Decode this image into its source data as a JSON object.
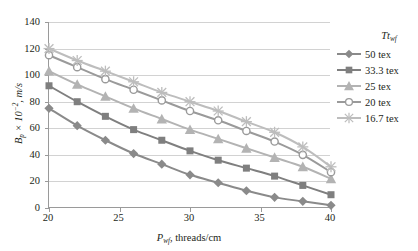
{
  "chart_data": {
    "type": "line",
    "title": "",
    "xlabel": "P_wf, threads/cm",
    "ylabel": "B_p x 10^-2, m/s",
    "xlim": [
      20,
      40
    ],
    "ylim": [
      0,
      140
    ],
    "xticks": [
      20,
      25,
      30,
      35,
      40
    ],
    "yticks": [
      0,
      20,
      40,
      60,
      80,
      100,
      120,
      140
    ],
    "grid": true,
    "legend_position": "right",
    "legend_title": "Tt_wf",
    "x": [
      20,
      22,
      24,
      26,
      28,
      30,
      32,
      34,
      36,
      38,
      40
    ],
    "series": [
      {
        "name": "50 tex",
        "marker": "diamond",
        "color": "#8a8a8a",
        "values": [
          75,
          62,
          51,
          41,
          33,
          25,
          19,
          13,
          8,
          5,
          2
        ]
      },
      {
        "name": "33.3 tex",
        "marker": "square",
        "color": "#7f7f7f",
        "values": [
          92,
          80,
          69,
          59,
          51,
          43,
          36,
          30,
          24,
          17,
          10
        ]
      },
      {
        "name": "25 tex",
        "marker": "triangle",
        "color": "#b3b3b3",
        "values": [
          103,
          93,
          84,
          75,
          67,
          59,
          52,
          45,
          38,
          31,
          22
        ]
      },
      {
        "name": "20 tex",
        "marker": "circle",
        "color": "#9a9a9a",
        "values": [
          115,
          106,
          97,
          89,
          81,
          73,
          66,
          58,
          50,
          40,
          27
        ]
      },
      {
        "name": "16.7 tex",
        "marker": "x",
        "color": "#bdbdbd",
        "values": [
          120,
          111,
          103,
          95,
          87,
          80,
          73,
          65,
          57,
          46,
          31
        ]
      }
    ]
  },
  "axis": {
    "x_label_symbol": "P",
    "x_label_sub": "wf",
    "x_label_rest": ", threads/cm",
    "y_label_symbol": "B",
    "y_label_sub": "p",
    "y_label_mid": " × 10",
    "y_label_sup": "−2",
    "y_label_rest": ", m/s"
  },
  "legend": {
    "title_main": "Tt",
    "title_sub": "wf",
    "items": [
      {
        "label": "50 tex"
      },
      {
        "label": "33.3 tex"
      },
      {
        "label": "25 tex"
      },
      {
        "label": "20 tex"
      },
      {
        "label": "16.7 tex"
      }
    ]
  }
}
